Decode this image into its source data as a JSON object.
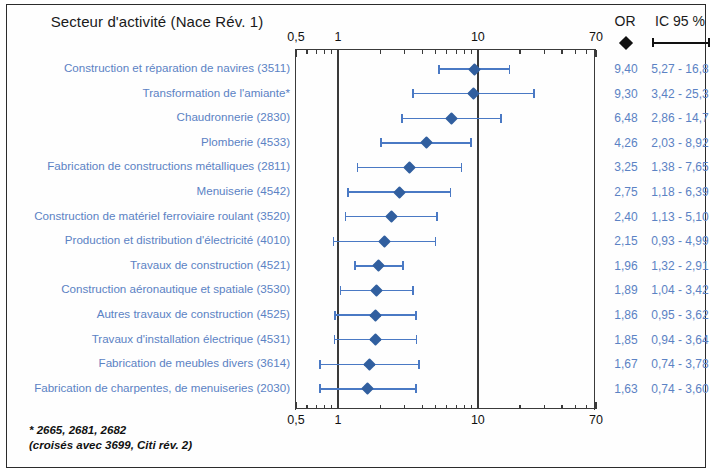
{
  "header": {
    "title": "Secteur d'activité (Nace Rév. 1)",
    "or_label": "OR",
    "ci_label": "IC 95 %",
    "or_legend_icon": "black-diamond-icon",
    "ci_legend_icon": "confidence-interval-bar-icon"
  },
  "footnote": {
    "line1": "* 2665, 2681, 2682",
    "line2": "(croisés avec 3699, Citi rév. 2)"
  },
  "colors": {
    "marker": "#315f9f",
    "interval": "#4a79c4",
    "label_text": "#5b82c4",
    "axis": "#3a3a3a",
    "frame": "#2b2b2b"
  },
  "chart_data": {
    "type": "scatter",
    "title": "Secteur d'activité (Nace Rév. 1)",
    "xlabel": "",
    "ylabel": "",
    "xscale": "log",
    "xlim": [
      0.5,
      70
    ],
    "grid": false,
    "tick_labels": [
      "0,5",
      "1",
      "10",
      "70"
    ],
    "tick_values": [
      0.5,
      1,
      10,
      70
    ],
    "gridline_values": [
      1,
      10
    ],
    "reference_line": 1,
    "legend": [
      "OR",
      "IC 95 %"
    ],
    "columns": [
      "Secteur d'activité (Nace Rév. 1)",
      "OR",
      "IC 95 %"
    ],
    "rows": [
      {
        "label": "Construction et réparation de navires (3511)",
        "or": 9.4,
        "or_text": "9,40",
        "low": 5.27,
        "high": 16.8,
        "ci_text": "5,27 - 16,8"
      },
      {
        "label": "Transformation de l'amiante*",
        "or": 9.3,
        "or_text": "9,30",
        "low": 3.42,
        "high": 25.3,
        "ci_text": "3,42 - 25,3"
      },
      {
        "label": "Chaudronnerie (2830)",
        "or": 6.48,
        "or_text": "6,48",
        "low": 2.86,
        "high": 14.7,
        "ci_text": "2,86 - 14,7"
      },
      {
        "label": "Plomberie (4533)",
        "or": 4.26,
        "or_text": "4,26",
        "low": 2.03,
        "high": 8.92,
        "ci_text": "2,03 - 8,92"
      },
      {
        "label": "Fabrication de constructions métalliques (2811)",
        "or": 3.25,
        "or_text": "3,25",
        "low": 1.38,
        "high": 7.65,
        "ci_text": "1,38 - 7,65"
      },
      {
        "label": "Menuiserie (4542)",
        "or": 2.75,
        "or_text": "2,75",
        "low": 1.18,
        "high": 6.39,
        "ci_text": "1,18 - 6,39"
      },
      {
        "label": "Construction de matériel ferroviaire roulant (3520)",
        "or": 2.4,
        "or_text": "2,40",
        "low": 1.13,
        "high": 5.1,
        "ci_text": "1,13 - 5,10"
      },
      {
        "label": "Production et distribution d'électricité (4010)",
        "or": 2.15,
        "or_text": "2,15",
        "low": 0.93,
        "high": 4.99,
        "ci_text": "0,93 - 4,99"
      },
      {
        "label": "Travaux de construction (4521)",
        "or": 1.96,
        "or_text": "1,96",
        "low": 1.32,
        "high": 2.91,
        "ci_text": "1,32 - 2,91"
      },
      {
        "label": "Construction aéronautique et spatiale (3530)",
        "or": 1.89,
        "or_text": "1,89",
        "low": 1.04,
        "high": 3.42,
        "ci_text": "1,04 - 3,42"
      },
      {
        "label": "Autres travaux de construction (4525)",
        "or": 1.86,
        "or_text": "1,86",
        "low": 0.95,
        "high": 3.62,
        "ci_text": "0,95 - 3,62"
      },
      {
        "label": "Travaux d'installation électrique (4531)",
        "or": 1.85,
        "or_text": "1,85",
        "low": 0.94,
        "high": 3.64,
        "ci_text": "0,94 - 3,64"
      },
      {
        "label": "Fabrication de meubles divers (3614)",
        "or": 1.67,
        "or_text": "1,67",
        "low": 0.74,
        "high": 3.78,
        "ci_text": "0,74 - 3,78"
      },
      {
        "label": "Fabrication de charpentes, de menuiseries (2030)",
        "or": 1.63,
        "or_text": "1,63",
        "low": 0.74,
        "high": 3.6,
        "ci_text": "0,74 - 3,60"
      }
    ]
  }
}
